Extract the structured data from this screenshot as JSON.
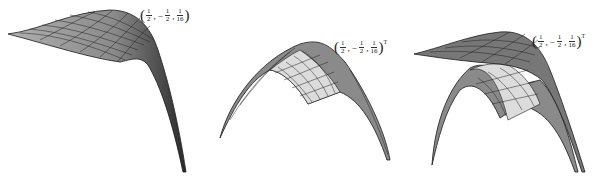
{
  "figure": {
    "panels": [
      {
        "id": "panel-1",
        "label": {
          "open": "(",
          "x_num": "1",
          "x_den": "2",
          "comma1": ",",
          "neg": "−",
          "y_num": "1",
          "y_den": "2",
          "comma2": ",",
          "z_num": "1",
          "z_den": "16",
          "close": ")",
          "transpose": "T"
        }
      },
      {
        "id": "panel-2",
        "label": {
          "open": "(",
          "x_num": "1",
          "x_den": "2",
          "comma1": ",",
          "neg": "−",
          "y_num": "1",
          "y_den": "2",
          "comma2": ",",
          "z_num": "1",
          "z_den": "16",
          "close": ")",
          "transpose": "T"
        }
      },
      {
        "id": "panel-3",
        "label": {
          "open": "(",
          "x_num": "1",
          "x_den": "2",
          "comma1": ",",
          "neg": "−",
          "y_num": "1",
          "y_den": "2",
          "comma2": ",",
          "z_num": "1",
          "z_den": "16",
          "close": ")",
          "transpose": "T"
        }
      }
    ],
    "point": "(1/2, -1/2, 1/16)^T",
    "colors": {
      "mesh_line": "#1a1a1a",
      "dark_fill": "#7a7a7a",
      "light_fill": "#dcdcdc"
    }
  }
}
